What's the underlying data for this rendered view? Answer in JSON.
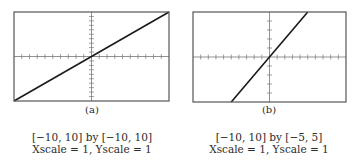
{
  "chart_data": [
    {
      "type": "line",
      "panel_label": "(a)",
      "function": "y = x",
      "xlim": [
        -10,
        10
      ],
      "ylim": [
        -10,
        10
      ],
      "xscale": 1,
      "yscale": 1,
      "x": [
        -10,
        10
      ],
      "y": [
        -10,
        10
      ],
      "window_text": "[−10, 10] by [−10, 10]",
      "scale_text": "Xscale = 1, Yscale = 1",
      "grid": false
    },
    {
      "type": "line",
      "panel_label": "(b)",
      "function": "y = x",
      "xlim": [
        -10,
        10
      ],
      "ylim": [
        -5,
        5
      ],
      "xscale": 1,
      "yscale": 1,
      "x": [
        -5,
        5
      ],
      "y": [
        -5,
        5
      ],
      "window_text": "[−10, 10] by [−5, 5]",
      "scale_text": "Xscale = 1, Yscale = 1",
      "grid": false
    }
  ],
  "colors": {
    "frame": "#555555",
    "line": "#1a1a1a",
    "axis": "#777777"
  }
}
